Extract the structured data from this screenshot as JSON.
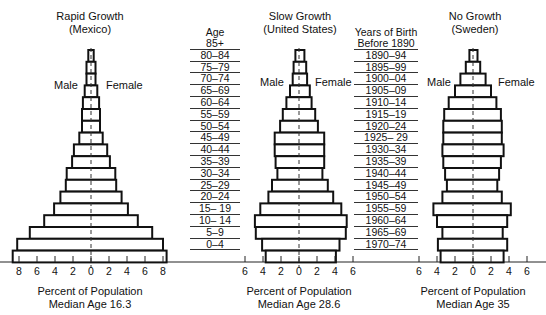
{
  "chart_data": [
    {
      "type": "bar",
      "subtype": "population-pyramid",
      "title": "Rapid Growth",
      "subtitle": "(Mexico)",
      "left_label": "Male",
      "right_label": "Female",
      "xlabel": "Percent of Population",
      "caption": "Median Age 16.3",
      "xlim": [
        -8,
        8
      ],
      "xticks": [
        8,
        6,
        4,
        2,
        0,
        2,
        4,
        6,
        8
      ],
      "categories": [
        "85+",
        "80-84",
        "75-79",
        "70-74",
        "65-69",
        "60-64",
        "55-59",
        "50-54",
        "45-49",
        "40-44",
        "35-39",
        "30-34",
        "25-29",
        "20-24",
        "15-19",
        "10-14",
        "5-9",
        "0-4"
      ],
      "series": [
        {
          "name": "Male",
          "values": [
            0.3,
            0.5,
            0.5,
            0.7,
            0.9,
            1.0,
            1.0,
            1.3,
            1.9,
            2.1,
            2.7,
            2.8,
            3.4,
            4.1,
            5.2,
            6.8,
            8.2,
            8.7
          ]
        },
        {
          "name": "Female",
          "values": [
            0.3,
            0.5,
            0.5,
            0.7,
            0.9,
            1.0,
            1.0,
            1.3,
            1.8,
            2.1,
            2.7,
            2.8,
            3.4,
            4.1,
            5.2,
            6.8,
            8.0,
            8.4
          ]
        }
      ]
    },
    {
      "type": "bar",
      "subtype": "population-pyramid",
      "title": "Slow Growth",
      "subtitle": "(United States)",
      "left_label": "Male",
      "right_label": "Female",
      "xlabel": "Percent of Population",
      "caption": "Median Age 28.6",
      "xlim": [
        -6,
        6
      ],
      "xticks": [
        6,
        4,
        2,
        0,
        2,
        4,
        6
      ],
      "categories": [
        "85+",
        "80-84",
        "75-79",
        "70-74",
        "65-69",
        "60-64",
        "55-59",
        "50-54",
        "45-49",
        "40-44",
        "35-39",
        "30-34",
        "25-29",
        "20-24",
        "15-19",
        "10-14",
        "5-9",
        "0-4"
      ],
      "birth_years": [
        "Before 1890",
        "1890-94",
        "1895-99",
        "1900-04",
        "1905-09",
        "1910-14",
        "1915-19",
        "1920-24",
        "1925-29",
        "1930-34",
        "1935-39",
        "1940-44",
        "1945-49",
        "1950-54",
        "1955-59",
        "1960-64",
        "1965-69",
        "1970-74"
      ],
      "series": [
        {
          "name": "Male",
          "values": [
            0.4,
            0.6,
            0.7,
            1.0,
            1.4,
            1.8,
            2.1,
            2.7,
            2.7,
            2.6,
            2.4,
            3.0,
            3.4,
            4.3,
            4.9,
            4.8,
            4.1,
            3.7
          ]
        },
        {
          "name": "Female",
          "values": [
            0.6,
            0.8,
            0.9,
            1.2,
            1.4,
            1.8,
            2.1,
            2.8,
            2.8,
            2.8,
            2.6,
            3.2,
            3.8,
            4.7,
            5.3,
            5.2,
            4.5,
            4.1
          ]
        }
      ]
    },
    {
      "type": "bar",
      "subtype": "population-pyramid",
      "title": "No Growth",
      "subtitle": "(Sweden)",
      "left_label": "Male",
      "right_label": "Female",
      "xlabel": "Percent of Population",
      "caption": "Median Age 35",
      "xlim": [
        -6,
        6
      ],
      "xticks": [
        6,
        4,
        2,
        0,
        2,
        4,
        6
      ],
      "categories": [
        "85+",
        "80-84",
        "75-79",
        "70-74",
        "65-69",
        "60-64",
        "55-59",
        "50-54",
        "45-49",
        "40-44",
        "35-39",
        "30-34",
        "25-29",
        "20-24",
        "15-19",
        "10-14",
        "5-9",
        "0-4"
      ],
      "series": [
        {
          "name": "Male",
          "values": [
            0.4,
            0.8,
            1.4,
            2.0,
            2.7,
            3.2,
            3.3,
            3.3,
            3.4,
            3.3,
            3.1,
            2.9,
            3.4,
            4.4,
            4.0,
            3.4,
            3.9,
            3.6
          ]
        },
        {
          "name": "Female",
          "values": [
            0.5,
            0.8,
            1.4,
            2.0,
            2.6,
            3.1,
            3.2,
            3.2,
            3.4,
            3.1,
            2.9,
            2.7,
            3.2,
            4.2,
            3.8,
            3.3,
            3.8,
            3.4
          ]
        }
      ]
    }
  ],
  "age_column": {
    "header": "Age",
    "labels": [
      "85+",
      "80–84",
      "75–79",
      "70–74",
      "65–69",
      "60–64",
      "55–59",
      "50–54",
      "45–49",
      "40–44",
      "35–39",
      "30–34",
      "25–29",
      "20–24",
      "15– 19",
      "10– 14",
      "5–9",
      "0–4"
    ]
  },
  "birth_column": {
    "header": "Years of Birth",
    "labels": [
      "Before 1890",
      "1890–94",
      "1895–99",
      "1900–04",
      "1905–09",
      "1910–14",
      "1915–19",
      "1920–24",
      "1925– 29",
      "1930–34",
      "1935–39",
      "1940–44",
      "1945–49",
      "1950–54",
      "1955–59",
      "1960–64",
      "1965–69",
      "1970–74"
    ]
  },
  "panels": [
    {
      "title": "Rapid Growth",
      "subtitle": "(Mexico)",
      "male": "Male",
      "female": "Female",
      "xlabel": "Percent of Population",
      "median": "Median Age 16.3",
      "ticks": [
        "8",
        "6",
        "4",
        "2",
        "0",
        "2",
        "4",
        "6",
        "8"
      ]
    },
    {
      "title": "Slow Growth",
      "subtitle": "(United States)",
      "male": "Male",
      "female": "Female",
      "xlabel": "Percent of Population",
      "median": "Median Age 28.6",
      "ticks": [
        "6",
        "4",
        "2",
        "0",
        "2",
        "4",
        "6"
      ]
    },
    {
      "title": "No Growth",
      "subtitle": "(Sweden)",
      "male": "Male",
      "female": "Female",
      "xlabel": "Percent of Population",
      "median": "Median Age 35",
      "ticks": [
        "6",
        "4",
        "2",
        "0",
        "2",
        "4",
        "6"
      ]
    }
  ]
}
